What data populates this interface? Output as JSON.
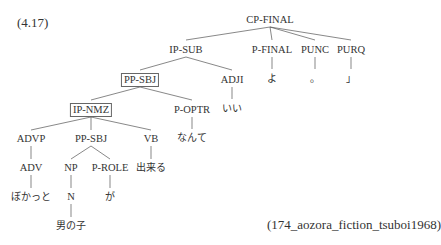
{
  "example_number": "(4.17)",
  "source": "(174_aozora_fiction_tsuboi1968)",
  "tree": {
    "nodes": {
      "cp_final": "CP-FINAL",
      "ip_sub": "IP-SUB",
      "p_final": "P-FINAL",
      "punc": "PUNC",
      "purq": "PURQ",
      "pp_sbj_outer": "PP-SBJ",
      "adji": "ADJI",
      "ip_nmz": "IP-NMZ",
      "p_optr": "P-OPTR",
      "advp": "ADVP",
      "pp_sbj_inner": "PP-SBJ",
      "vb": "VB",
      "adv": "ADV",
      "np": "NP",
      "p_role": "P-ROLE",
      "n": "N"
    },
    "leaves": {
      "yo": "よ",
      "period": "。",
      "close_quote": "」",
      "ii": "いい",
      "nante": "なんて",
      "dekiru": "出来る",
      "bokatto": "ぼかっと",
      "ga": "が",
      "otokonoko": "男の子"
    },
    "boxed_nodes": [
      "PP-SBJ (outer)",
      "IP-NMZ"
    ]
  }
}
